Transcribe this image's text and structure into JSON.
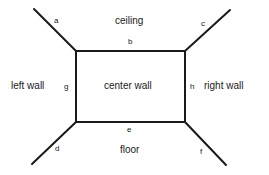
{
  "diagram": {
    "regions": {
      "ceiling": "ceiling",
      "left_wall": "left wall",
      "center_wall": "center wall",
      "right_wall": "right wall",
      "floor": "floor"
    },
    "edges": {
      "a": "a",
      "b": "b",
      "c": "c",
      "d": "d",
      "e": "e",
      "f": "f",
      "g": "g",
      "h": "h"
    },
    "colors": {
      "line": "#1a1a1a",
      "background": "#ffffff"
    }
  }
}
